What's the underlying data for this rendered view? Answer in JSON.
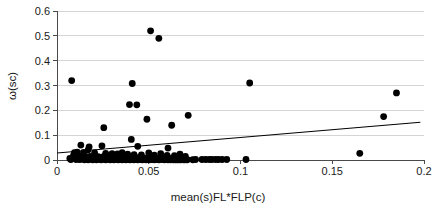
{
  "chart_data": {
    "type": "scatter",
    "title": "",
    "xlabel": "mean(s)FL*FLP(c)",
    "ylabel": "ω(sc)",
    "xlim": [
      0,
      0.2
    ],
    "ylim": [
      0,
      0.6
    ],
    "xticks": [
      "0",
      "0.05",
      "0.1",
      "0.15",
      "0.2"
    ],
    "xtick_values": [
      0,
      0.05,
      0.1,
      0.15,
      0.2
    ],
    "yticks": [
      "0",
      "0.1",
      "0.2",
      "0.3",
      "0.4",
      "0.5",
      "0.6"
    ],
    "ytick_values": [
      0,
      0.1,
      0.2,
      0.3,
      0.4,
      0.5,
      0.6
    ],
    "grid": "horizontal",
    "legend": "none",
    "point_color": "#000000",
    "point_radius": 3.4,
    "trend_color": "#000000",
    "trendline": {
      "label": "linear fit",
      "x_start": 0.0,
      "y_start": 0.028,
      "x_end": 0.198,
      "y_end": 0.152
    },
    "series": [
      {
        "name": "observations",
        "points": [
          [
            0.008,
            0.32
          ],
          [
            0.051,
            0.52
          ],
          [
            0.0555,
            0.49
          ],
          [
            0.041,
            0.308
          ],
          [
            0.105,
            0.31
          ],
          [
            0.185,
            0.27
          ],
          [
            0.0395,
            0.223
          ],
          [
            0.0435,
            0.222
          ],
          [
            0.0715,
            0.18
          ],
          [
            0.178,
            0.175
          ],
          [
            0.049,
            0.164
          ],
          [
            0.0625,
            0.14
          ],
          [
            0.0255,
            0.13
          ],
          [
            0.0405,
            0.083
          ],
          [
            0.013,
            0.06
          ],
          [
            0.0245,
            0.057
          ],
          [
            0.044,
            0.055
          ],
          [
            0.0175,
            0.053
          ],
          [
            0.0605,
            0.048
          ],
          [
            0.017,
            0.041
          ],
          [
            0.011,
            0.032
          ],
          [
            0.0145,
            0.031
          ],
          [
            0.165,
            0.027
          ],
          [
            0.0095,
            0.03
          ],
          [
            0.0205,
            0.029
          ],
          [
            0.0355,
            0.03
          ],
          [
            0.05,
            0.029
          ],
          [
            0.0565,
            0.026
          ],
          [
            0.067,
            0.024
          ],
          [
            0.0265,
            0.027
          ],
          [
            0.03,
            0.026
          ],
          [
            0.033,
            0.025
          ],
          [
            0.0385,
            0.024
          ],
          [
            0.042,
            0.022
          ],
          [
            0.046,
            0.021
          ],
          [
            0.053,
            0.02
          ],
          [
            0.06,
            0.019
          ],
          [
            0.064,
            0.018
          ],
          [
            0.07,
            0.014
          ],
          [
            0.009,
            0.019
          ],
          [
            0.0115,
            0.017
          ],
          [
            0.0135,
            0.016
          ],
          [
            0.0155,
            0.015
          ],
          [
            0.018,
            0.014
          ],
          [
            0.02,
            0.013
          ],
          [
            0.0225,
            0.013
          ],
          [
            0.025,
            0.012
          ],
          [
            0.0275,
            0.012
          ],
          [
            0.0295,
            0.011
          ],
          [
            0.0315,
            0.011
          ],
          [
            0.034,
            0.01
          ],
          [
            0.036,
            0.01
          ],
          [
            0.038,
            0.01
          ],
          [
            0.04,
            0.009
          ],
          [
            0.0425,
            0.009
          ],
          [
            0.0445,
            0.009
          ],
          [
            0.047,
            0.008
          ],
          [
            0.049,
            0.008
          ],
          [
            0.0515,
            0.008
          ],
          [
            0.054,
            0.007
          ],
          [
            0.056,
            0.007
          ],
          [
            0.058,
            0.007
          ],
          [
            0.061,
            0.006
          ],
          [
            0.063,
            0.006
          ],
          [
            0.066,
            0.006
          ],
          [
            0.0685,
            0.005
          ],
          [
            0.007,
            0.006
          ],
          [
            0.0085,
            0.005
          ],
          [
            0.01,
            0.005
          ],
          [
            0.012,
            0.004
          ],
          [
            0.014,
            0.004
          ],
          [
            0.016,
            0.004
          ],
          [
            0.0185,
            0.003
          ],
          [
            0.021,
            0.003
          ],
          [
            0.023,
            0.003
          ],
          [
            0.0255,
            0.003
          ],
          [
            0.028,
            0.003
          ],
          [
            0.0305,
            0.002
          ],
          [
            0.0325,
            0.002
          ],
          [
            0.0345,
            0.002
          ],
          [
            0.0365,
            0.002
          ],
          [
            0.039,
            0.002
          ],
          [
            0.041,
            0.002
          ],
          [
            0.043,
            0.002
          ],
          [
            0.045,
            0.002
          ],
          [
            0.0475,
            0.002
          ],
          [
            0.0495,
            0.002
          ],
          [
            0.052,
            0.002
          ],
          [
            0.0545,
            0.002
          ],
          [
            0.057,
            0.002
          ],
          [
            0.0595,
            0.002
          ],
          [
            0.062,
            0.001
          ],
          [
            0.0645,
            0.001
          ],
          [
            0.0665,
            0.001
          ],
          [
            0.069,
            0.001
          ],
          [
            0.071,
            0.001
          ],
          [
            0.074,
            0.001
          ],
          [
            0.0755,
            0.002
          ],
          [
            0.079,
            0.002
          ],
          [
            0.081,
            0.002
          ],
          [
            0.083,
            0.002
          ],
          [
            0.0845,
            0.002
          ],
          [
            0.0865,
            0.002
          ],
          [
            0.088,
            0.002
          ],
          [
            0.09,
            0.002
          ],
          [
            0.0925,
            0.002
          ],
          [
            0.103,
            0.002
          ],
          [
            0.0075,
            0.002
          ],
          [
            0.0105,
            0.002
          ],
          [
            0.0125,
            0.002
          ],
          [
            0.015,
            0.001
          ],
          [
            0.017,
            0.001
          ],
          [
            0.0195,
            0.001
          ],
          [
            0.0215,
            0.001
          ],
          [
            0.024,
            0.001
          ],
          [
            0.0265,
            0.001
          ],
          [
            0.029,
            0.001
          ],
          [
            0.031,
            0.001
          ],
          [
            0.0335,
            0.001
          ],
          [
            0.0355,
            0.001
          ],
          [
            0.0375,
            0.001
          ],
          [
            0.0398,
            0.001
          ],
          [
            0.0418,
            0.001
          ],
          [
            0.044,
            0.001
          ],
          [
            0.0465,
            0.001
          ],
          [
            0.0485,
            0.001
          ],
          [
            0.0505,
            0.001
          ],
          [
            0.053,
            0.001
          ],
          [
            0.0555,
            0.001
          ],
          [
            0.0585,
            0.001
          ],
          [
            0.0605,
            0.001
          ],
          [
            0.0635,
            0.001
          ],
          [
            0.0655,
            0.001
          ],
          [
            0.0675,
            0.001
          ],
          [
            0.07,
            0.001
          ]
        ]
      }
    ]
  }
}
